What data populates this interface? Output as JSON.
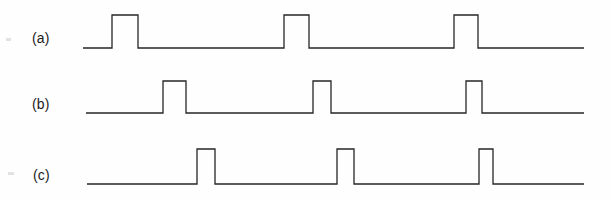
{
  "figure": {
    "background_color": "#fefefe",
    "line_color": "#262626",
    "label_color": "#1b1b1b",
    "width": 613,
    "height": 199
  },
  "traces": [
    {
      "id": "a",
      "label": "(a)",
      "baseline_y": 48,
      "high_y": 15,
      "x_start": 83,
      "x_end": 584,
      "pulses": [
        {
          "rise": 112,
          "fall": 138
        },
        {
          "rise": 284,
          "fall": 309
        },
        {
          "rise": 454,
          "fall": 478
        }
      ]
    },
    {
      "id": "b",
      "label": "(b)",
      "baseline_y": 113,
      "high_y": 81,
      "x_start": 86,
      "x_end": 584,
      "pulses": [
        {
          "rise": 163,
          "fall": 186
        },
        {
          "rise": 313,
          "fall": 331
        },
        {
          "rise": 466,
          "fall": 482
        }
      ]
    },
    {
      "id": "c",
      "label": "(c)",
      "baseline_y": 184,
      "high_y": 149,
      "x_start": 87,
      "x_end": 584,
      "pulses": [
        {
          "rise": 197,
          "fall": 215
        },
        {
          "rise": 337,
          "fall": 354
        },
        {
          "rise": 479,
          "fall": 493
        }
      ]
    }
  ],
  "chart_data": {
    "type": "line",
    "xlabel": "",
    "ylabel": "",
    "legend": [
      "(a)",
      "(b)",
      "(c)"
    ],
    "grid": false,
    "series": [
      {
        "name": "(a)",
        "levels": "digital",
        "low": 0,
        "high": 1,
        "transitions_x": [
          83,
          112,
          112,
          138,
          138,
          584
        ],
        "transitions_y": [
          0,
          0,
          1,
          1,
          0,
          0
        ]
      },
      {
        "name": "(b)",
        "levels": "digital",
        "low": 0,
        "high": 1,
        "transitions_x": [
          86,
          163,
          163,
          186,
          186,
          584
        ],
        "transitions_y": [
          0,
          0,
          1,
          1,
          0,
          0
        ]
      },
      {
        "name": "(c)",
        "levels": "digital",
        "low": 0,
        "high": 1,
        "transitions_x": [
          87,
          197,
          197,
          215,
          215,
          584
        ],
        "transitions_y": [
          0,
          0,
          1,
          1,
          0,
          0
        ]
      }
    ]
  }
}
